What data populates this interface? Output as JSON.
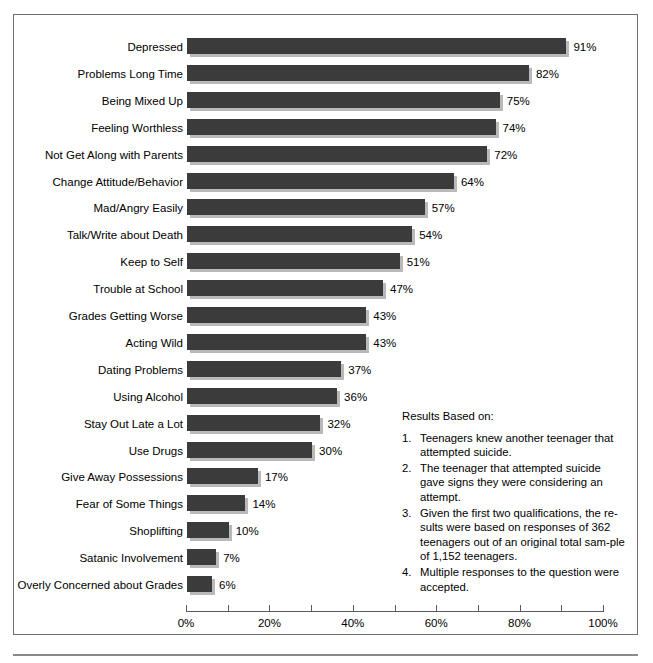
{
  "chart_data": {
    "type": "bar",
    "orientation": "horizontal",
    "title": "",
    "xlabel": "",
    "ylabel": "",
    "xlim": [
      0,
      100
    ],
    "grid": false,
    "legend": null,
    "value_suffix": "%",
    "categories": [
      "Depressed",
      "Problems Long Time",
      "Being Mixed Up",
      "Feeling Worthless",
      "Not Get Along with Parents",
      "Change Attitude/Behavior",
      "Mad/Angry Easily",
      "Talk/Write about Death",
      "Keep to Self",
      "Trouble at School",
      "Grades Getting Worse",
      "Acting Wild",
      "Dating Problems",
      "Using Alcohol",
      "Stay Out Late a Lot",
      "Use Drugs",
      "Give Away Possessions",
      "Fear of Some Things",
      "Shoplifting",
      "Satanic Involvement",
      "Overly Concerned about Grades"
    ],
    "values": [
      91,
      82,
      75,
      74,
      72,
      64,
      57,
      54,
      51,
      47,
      43,
      43,
      37,
      36,
      32,
      30,
      17,
      14,
      10,
      7,
      6
    ],
    "value_labels": [
      "91%",
      "82%",
      "75%",
      "74%",
      "72%",
      "64%",
      "57%",
      "54%",
      "51%",
      "47%",
      "43%",
      "43%",
      "37%",
      "36%",
      "32%",
      "30%",
      "17%",
      "14%",
      "10%",
      "7%",
      "6%"
    ],
    "xticks": [
      0,
      10,
      20,
      30,
      40,
      50,
      60,
      70,
      80,
      90,
      100
    ],
    "xtick_labels": [
      "0%",
      "",
      "20%",
      "",
      "40%",
      "",
      "60%",
      "",
      "80%",
      "",
      "100%"
    ],
    "bar_color": "#3b3b3b",
    "bar_shadow_color": "#b9b9b9",
    "axis_color": "#5a5a5a",
    "frame_color": "#6d6d6d",
    "background": "#ffffff"
  },
  "notes": {
    "heading": "Results Based on:",
    "items": [
      {
        "num": "1.",
        "text": "Teenagers knew another teenager that attempted suicide."
      },
      {
        "num": "2.",
        "text": "The teenager that attempted suicide gave signs they were considering an attempt."
      },
      {
        "num": "3.",
        "text": "Given the first two qualifications, the re-sults were based on responses of 362 teenagers out of an original total sam-ple of 1,152 teenagers."
      },
      {
        "num": "4.",
        "text": "Multiple responses to the question were accepted."
      }
    ]
  }
}
